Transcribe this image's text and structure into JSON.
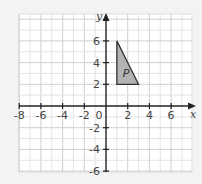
{
  "chart_data": {
    "type": "scatter",
    "title": "",
    "xlabel": "x",
    "ylabel": "y",
    "xlim": [
      -8,
      7.9
    ],
    "ylim": [
      -6,
      8.4
    ],
    "grid": true,
    "x_ticks": [
      -8,
      -6,
      -4,
      -2,
      0,
      2,
      4,
      6
    ],
    "y_ticks": [
      -6,
      -4,
      -2,
      2,
      4,
      6
    ],
    "x_tick_labels": [
      "-8",
      "-6",
      "-4",
      "-2",
      "0",
      "2",
      "4",
      "6"
    ],
    "y_tick_labels": [
      "-6",
      "-4",
      "-2",
      "2",
      "4",
      "6"
    ],
    "shapes": [
      {
        "name": "P",
        "kind": "triangle",
        "vertices": [
          [
            1,
            6
          ],
          [
            1,
            2
          ],
          [
            3,
            2
          ]
        ],
        "fill": "#b3b3b3",
        "stroke": "#333333"
      }
    ]
  },
  "colors": {
    "background": "#f3f3f3",
    "grid_bg": "#ffffff",
    "grid_line": "#d9d9d9",
    "axis": "#222222"
  }
}
